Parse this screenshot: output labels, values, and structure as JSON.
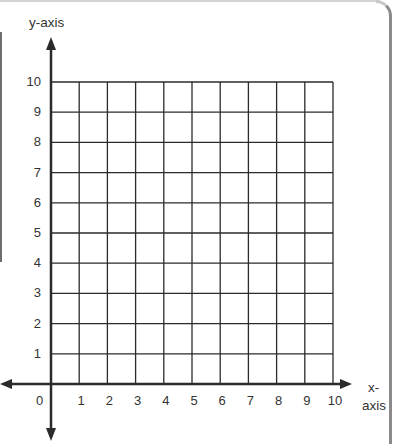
{
  "graph": {
    "y_axis_label": "y-axis",
    "x_axis_label_line1": "x-",
    "x_axis_label_line2": "axis",
    "origin_label": "0",
    "x_ticks": [
      "1",
      "2",
      "3",
      "4",
      "5",
      "6",
      "7",
      "8",
      "9",
      "10"
    ],
    "y_ticks": [
      "1",
      "2",
      "3",
      "4",
      "5",
      "6",
      "7",
      "8",
      "9",
      "10"
    ],
    "grid_color": "#2b2b2b",
    "axis_color": "#2b2b2b"
  },
  "chart_data": {
    "type": "grid",
    "title": "",
    "xlabel": "x-axis",
    "ylabel": "y-axis",
    "xlim": [
      0,
      10
    ],
    "ylim": [
      0,
      10
    ],
    "x_tick_labels": [
      "0",
      "1",
      "2",
      "3",
      "4",
      "5",
      "6",
      "7",
      "8",
      "9",
      "10"
    ],
    "y_tick_labels": [
      "1",
      "2",
      "3",
      "4",
      "5",
      "6",
      "7",
      "8",
      "9",
      "10"
    ],
    "grid": true,
    "series": []
  }
}
